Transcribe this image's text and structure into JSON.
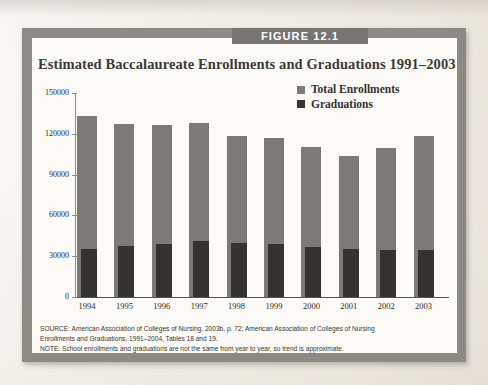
{
  "figure": {
    "banner_label": "FIGURE 12.1",
    "title": "Estimated Baccalaureate Enrollments and Graduations 1991–2003"
  },
  "legend": {
    "items": [
      {
        "label": "Total Enrollments",
        "color": "#7b7a76"
      },
      {
        "label": "Graduations",
        "color": "#343330"
      }
    ]
  },
  "notes": {
    "line1": "SOURCE: American Association of Colleges of Nursing, 2003b, p. 72; American Association of Colleges of Nursing",
    "line2": "Enrollments and Graduations, 1991–2004, Tables 18 and 19.",
    "line3": "NOTE: School enrollments and graduations are not the same from year to year, so trend is approximate."
  },
  "axis": {
    "y_ticks": [
      "150000",
      "120000",
      "90000",
      "60000",
      "30000",
      "0"
    ],
    "x_ticks": [
      "1994",
      "1995",
      "1996",
      "1997",
      "1998",
      "1999",
      "2000",
      "2001",
      "2002",
      "2003"
    ]
  },
  "colors": {
    "frame": "#8b8a85",
    "banner": "#767571",
    "panel": "#fbfaf7",
    "enrollments": "#7b7a76",
    "graduations": "#343330",
    "page": "#efece6"
  },
  "chart_data": {
    "type": "bar",
    "title": "Estimated Baccalaureate Enrollments and Graduations 1991–2003",
    "xlabel": "",
    "ylabel": "",
    "ylim": [
      0,
      150000
    ],
    "ytick_interval": 30000,
    "grid": false,
    "legend_position": "top-right",
    "categories": [
      "1994",
      "1995",
      "1996",
      "1997",
      "1998",
      "1999",
      "2000",
      "2001",
      "2002",
      "2003"
    ],
    "series": [
      {
        "name": "Total Enrollments",
        "color": "#7b7a76",
        "values": [
          133000,
          127500,
          126500,
          128000,
          118500,
          117000,
          110500,
          104000,
          109500,
          118500
        ]
      },
      {
        "name": "Graduations",
        "color": "#343330",
        "values": [
          35500,
          37500,
          39000,
          41500,
          39500,
          39000,
          36500,
          35000,
          34500,
          34500
        ]
      }
    ]
  }
}
